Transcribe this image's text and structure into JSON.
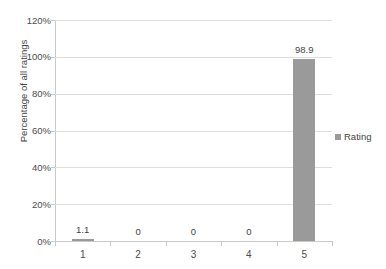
{
  "chart_data": {
    "type": "bar",
    "title": "",
    "xlabel": "",
    "ylabel": "Percentage of all ratings",
    "categories": [
      "1",
      "2",
      "3",
      "4",
      "5"
    ],
    "values": [
      1.1,
      0,
      0,
      0,
      98.9
    ],
    "data_labels": [
      "1.1",
      "0",
      "0",
      "0",
      "98.9"
    ],
    "series": [
      {
        "name": "Rating",
        "values": [
          1.1,
          0,
          0,
          0,
          98.9
        ],
        "color": "#9a9a9a"
      }
    ],
    "ylim": [
      0,
      120
    ],
    "ytick_values": [
      0,
      20,
      40,
      60,
      80,
      100,
      120
    ],
    "ytick_labels": [
      "0%",
      "20%",
      "40%",
      "60%",
      "80%",
      "100%",
      "120%"
    ],
    "grid": true,
    "grid_axis": "y",
    "legend_position": "right",
    "legend_entries": [
      "Rating"
    ],
    "gridline_color": "#dededd",
    "axis_color": "#c9c9c8",
    "text_color": "#3f3f3f",
    "background_color": "#ffffff"
  },
  "legend": {
    "label": "Rating",
    "swatch_name": "legend-color-swatch"
  }
}
